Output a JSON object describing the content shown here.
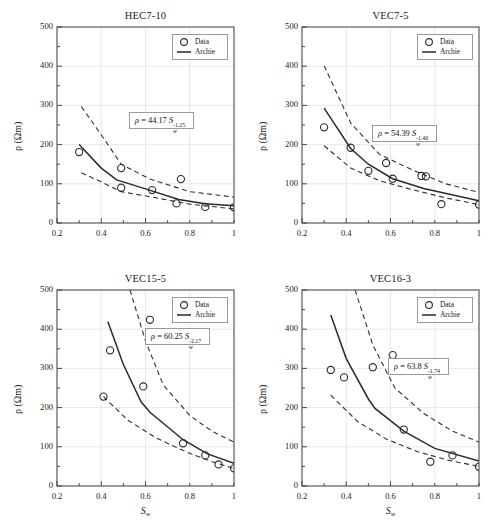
{
  "figure": {
    "panels": [
      {
        "id": "hec7-10",
        "title": "HEC7-10",
        "equation": {
          "rho": "ρ",
          "eq": "=",
          "coef": "44.17",
          "svar": "S",
          "ssub": "w",
          "exp": "-1.25"
        },
        "legend": {
          "data_label": "Data",
          "fit_label": "Archie"
        },
        "xlabel_main": "S",
        "xlabel_sub": "w",
        "ylabel": "ρ (Ωm)",
        "xticks": [
          "0.2",
          "0.4",
          "0.6",
          "0.8",
          "1"
        ],
        "yticks": [
          "0",
          "100",
          "200",
          "300",
          "400",
          "500"
        ]
      },
      {
        "id": "vec7-5",
        "title": "VEC7-5",
        "equation": {
          "rho": "ρ",
          "eq": "=",
          "coef": "54.39",
          "svar": "S",
          "ssub": "w",
          "exp": "-1.40"
        },
        "legend": {
          "data_label": "Data",
          "fit_label": "Archie"
        },
        "xlabel_main": "S",
        "xlabel_sub": "w",
        "ylabel": "ρ (Ωm)",
        "xticks": [
          "0.2",
          "0.4",
          "0.6",
          "0.8",
          "1"
        ],
        "yticks": [
          "0",
          "100",
          "200",
          "300",
          "400",
          "500"
        ]
      },
      {
        "id": "vec15-5",
        "title": "VEC15-5",
        "equation": {
          "rho": "ρ",
          "eq": "=",
          "coef": "60.25",
          "svar": "S",
          "ssub": "w",
          "exp": "-2.17"
        },
        "legend": {
          "data_label": "Data",
          "fit_label": "Archie"
        },
        "xlabel_main": "S",
        "xlabel_sub": "w",
        "ylabel": "ρ (Ωm)",
        "xticks": [
          "0.2",
          "0.4",
          "0.6",
          "0.8",
          "1"
        ],
        "yticks": [
          "0",
          "100",
          "200",
          "300",
          "400",
          "500"
        ]
      },
      {
        "id": "vec16-3",
        "title": "VEC16-3",
        "equation": {
          "rho": "ρ",
          "eq": "=",
          "coef": "63.8",
          "svar": "S",
          "ssub": "w",
          "exp": "-1.74"
        },
        "legend": {
          "data_label": "Data",
          "fit_label": "Archie"
        },
        "xlabel_main": "S",
        "xlabel_sub": "w",
        "ylabel": "ρ (Ωm)",
        "xticks": [
          "0.2",
          "0.4",
          "0.6",
          "0.8",
          "1"
        ],
        "yticks": [
          "0",
          "100",
          "200",
          "300",
          "400",
          "500"
        ]
      }
    ]
  },
  "chart_data": [
    {
      "type": "scatter",
      "title": "HEC7-10",
      "xlabel": "Sw",
      "ylabel": "rho (Ohm m)",
      "xlim": [
        0.2,
        1.0
      ],
      "ylim": [
        0,
        500
      ],
      "grid": true,
      "legend": [
        "Data",
        "Archie"
      ],
      "legend_position": "top-right",
      "annotation": "rho = 44.17 Sw^-1.25",
      "archie": {
        "a": 44.17,
        "m": 1.25
      },
      "points": [
        {
          "sw": 0.3,
          "rho": 181
        },
        {
          "sw": 0.49,
          "rho": 140
        },
        {
          "sw": 0.49,
          "rho": 90
        },
        {
          "sw": 0.63,
          "rho": 84
        },
        {
          "sw": 0.74,
          "rho": 50
        },
        {
          "sw": 0.76,
          "rho": 112
        },
        {
          "sw": 0.87,
          "rho": 41
        },
        {
          "sw": 1.0,
          "rho": 40
        }
      ],
      "fit_curve": [
        {
          "sw": 0.3,
          "rho": 200
        },
        {
          "sw": 0.4,
          "rho": 140
        },
        {
          "sw": 0.47,
          "rho": 110
        },
        {
          "sw": 0.6,
          "rho": 87
        },
        {
          "sw": 0.75,
          "rho": 60
        },
        {
          "sw": 0.87,
          "rho": 49
        },
        {
          "sw": 1.0,
          "rho": 44
        }
      ],
      "upper_bound": [
        {
          "sw": 0.31,
          "rho": 297
        },
        {
          "sw": 0.4,
          "rho": 225
        },
        {
          "sw": 0.49,
          "rho": 150
        },
        {
          "sw": 0.62,
          "rho": 112
        },
        {
          "sw": 0.8,
          "rho": 80
        },
        {
          "sw": 1.0,
          "rho": 66
        }
      ],
      "lower_bound": [
        {
          "sw": 0.31,
          "rho": 128
        },
        {
          "sw": 0.4,
          "rho": 105
        },
        {
          "sw": 0.49,
          "rho": 80
        },
        {
          "sw": 0.63,
          "rho": 66
        },
        {
          "sw": 0.8,
          "rho": 48
        },
        {
          "sw": 1.0,
          "rho": 36
        }
      ]
    },
    {
      "type": "scatter",
      "title": "VEC7-5",
      "xlabel": "Sw",
      "ylabel": "rho (Ohm m)",
      "xlim": [
        0.2,
        1.0
      ],
      "ylim": [
        0,
        500
      ],
      "grid": true,
      "legend": [
        "Data",
        "Archie"
      ],
      "legend_position": "top-right",
      "annotation": "rho = 54.39 Sw^-1.40",
      "archie": {
        "a": 54.39,
        "m": 1.4
      },
      "points": [
        {
          "sw": 0.3,
          "rho": 244
        },
        {
          "sw": 0.42,
          "rho": 192
        },
        {
          "sw": 0.5,
          "rho": 133
        },
        {
          "sw": 0.58,
          "rho": 153
        },
        {
          "sw": 0.61,
          "rho": 113
        },
        {
          "sw": 0.74,
          "rho": 120
        },
        {
          "sw": 0.76,
          "rho": 119
        },
        {
          "sw": 0.83,
          "rho": 48
        },
        {
          "sw": 1.0,
          "rho": 47
        }
      ],
      "fit_curve": [
        {
          "sw": 0.3,
          "rho": 293
        },
        {
          "sw": 0.42,
          "rho": 190
        },
        {
          "sw": 0.5,
          "rho": 150
        },
        {
          "sw": 0.61,
          "rho": 113
        },
        {
          "sw": 0.75,
          "rho": 88
        },
        {
          "sw": 1.0,
          "rho": 57
        }
      ],
      "upper_bound": [
        {
          "sw": 0.3,
          "rho": 401
        },
        {
          "sw": 0.42,
          "rho": 255
        },
        {
          "sw": 0.55,
          "rho": 175
        },
        {
          "sw": 0.7,
          "rho": 135
        },
        {
          "sw": 0.85,
          "rho": 100
        },
        {
          "sw": 1.0,
          "rho": 78
        }
      ],
      "lower_bound": [
        {
          "sw": 0.3,
          "rho": 197
        },
        {
          "sw": 0.42,
          "rho": 140
        },
        {
          "sw": 0.55,
          "rho": 108
        },
        {
          "sw": 0.7,
          "rho": 85
        },
        {
          "sw": 0.85,
          "rho": 64
        },
        {
          "sw": 1.0,
          "rho": 47
        }
      ]
    },
    {
      "type": "scatter",
      "title": "VEC15-5",
      "xlabel": "Sw",
      "ylabel": "rho (Ohm m)",
      "xlim": [
        0.2,
        1.0
      ],
      "ylim": [
        0,
        500
      ],
      "grid": true,
      "legend": [
        "Data",
        "Archie"
      ],
      "legend_position": "top-right",
      "annotation": "rho = 60.25 Sw^-2.17",
      "archie": {
        "a": 60.25,
        "m": 2.17
      },
      "points": [
        {
          "sw": 0.41,
          "rho": 228
        },
        {
          "sw": 0.44,
          "rho": 346
        },
        {
          "sw": 0.59,
          "rho": 254
        },
        {
          "sw": 0.62,
          "rho": 424
        },
        {
          "sw": 0.77,
          "rho": 109
        },
        {
          "sw": 0.87,
          "rho": 78
        },
        {
          "sw": 0.93,
          "rho": 55
        },
        {
          "sw": 1.0,
          "rho": 45
        }
      ],
      "fit_curve": [
        {
          "sw": 0.43,
          "rho": 419
        },
        {
          "sw": 0.5,
          "rho": 310
        },
        {
          "sw": 0.58,
          "rho": 215
        },
        {
          "sw": 0.62,
          "rho": 188
        },
        {
          "sw": 0.77,
          "rho": 118
        },
        {
          "sw": 0.88,
          "rho": 82
        },
        {
          "sw": 1.0,
          "rho": 58
        }
      ],
      "upper_bound": [
        {
          "sw": 0.53,
          "rho": 500
        },
        {
          "sw": 0.6,
          "rho": 370
        },
        {
          "sw": 0.68,
          "rho": 258
        },
        {
          "sw": 0.8,
          "rho": 180
        },
        {
          "sw": 0.9,
          "rho": 140
        },
        {
          "sw": 1.0,
          "rho": 112
        }
      ],
      "lower_bound": [
        {
          "sw": 0.41,
          "rho": 228
        },
        {
          "sw": 0.52,
          "rho": 168
        },
        {
          "sw": 0.65,
          "rho": 122
        },
        {
          "sw": 0.78,
          "rho": 88
        },
        {
          "sw": 0.9,
          "rho": 62
        },
        {
          "sw": 1.0,
          "rho": 45
        }
      ]
    },
    {
      "type": "scatter",
      "title": "VEC16-3",
      "xlabel": "Sw",
      "ylabel": "rho (Ohm m)",
      "xlim": [
        0.2,
        1.0
      ],
      "ylim": [
        0,
        500
      ],
      "grid": true,
      "legend": [
        "Data",
        "Archie"
      ],
      "legend_position": "top-right",
      "annotation": "rho = 63.8 Sw^-1.74",
      "archie": {
        "a": 63.8,
        "m": 1.74
      },
      "points": [
        {
          "sw": 0.33,
          "rho": 296
        },
        {
          "sw": 0.39,
          "rho": 277
        },
        {
          "sw": 0.52,
          "rho": 303
        },
        {
          "sw": 0.61,
          "rho": 334
        },
        {
          "sw": 0.66,
          "rho": 144
        },
        {
          "sw": 0.78,
          "rho": 62
        },
        {
          "sw": 0.88,
          "rho": 78
        },
        {
          "sw": 1.0,
          "rho": 49
        }
      ],
      "fit_curve": [
        {
          "sw": 0.33,
          "rho": 436
        },
        {
          "sw": 0.4,
          "rho": 325
        },
        {
          "sw": 0.5,
          "rho": 222
        },
        {
          "sw": 0.53,
          "rho": 198
        },
        {
          "sw": 0.66,
          "rho": 140
        },
        {
          "sw": 0.8,
          "rho": 96
        },
        {
          "sw": 1.0,
          "rho": 64
        }
      ],
      "upper_bound": [
        {
          "sw": 0.44,
          "rho": 500
        },
        {
          "sw": 0.52,
          "rho": 360
        },
        {
          "sw": 0.62,
          "rho": 250
        },
        {
          "sw": 0.75,
          "rho": 185
        },
        {
          "sw": 0.88,
          "rho": 140
        },
        {
          "sw": 1.0,
          "rho": 112
        }
      ],
      "lower_bound": [
        {
          "sw": 0.33,
          "rho": 232
        },
        {
          "sw": 0.45,
          "rho": 165
        },
        {
          "sw": 0.58,
          "rho": 120
        },
        {
          "sw": 0.72,
          "rho": 88
        },
        {
          "sw": 0.86,
          "rho": 66
        },
        {
          "sw": 1.0,
          "rho": 50
        }
      ]
    }
  ]
}
